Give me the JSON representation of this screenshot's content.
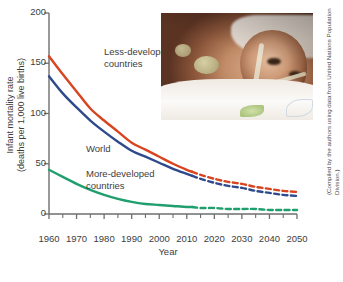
{
  "chart_data": {
    "type": "line",
    "title": "",
    "xlabel": "Year",
    "ylabel": "Infant mortality rate (deaths per 1,000 live births)",
    "ylabel_line1": "Infant mortality rate",
    "ylabel_line2": "(deaths per 1,000 live births)",
    "xlim": [
      1960,
      2050
    ],
    "ylim": [
      0,
      200
    ],
    "yticks": [
      0,
      50,
      100,
      150,
      200
    ],
    "ytick_labels": [
      "0",
      "50",
      "100",
      "150",
      "200"
    ],
    "xticks": [
      1960,
      1970,
      1980,
      1990,
      2000,
      2010,
      2020,
      2030,
      2040,
      2050
    ],
    "xtick_labels": [
      "1960",
      "1970",
      "1980",
      "1990",
      "2000",
      "2010",
      "2020",
      "2030",
      "2040",
      "2050"
    ],
    "xminor_step": 5,
    "grid": false,
    "legend": "inline-annotations",
    "projection_starts": 2012,
    "x": [
      1960,
      1965,
      1970,
      1975,
      1980,
      1985,
      1990,
      1995,
      2000,
      2005,
      2010,
      2012,
      2015,
      2020,
      2025,
      2030,
      2035,
      2040,
      2045,
      2050
    ],
    "series": [
      {
        "name": "Less-developed countries",
        "color": "#d8441f",
        "values": [
          157,
          139,
          122,
          105,
          93,
          82,
          71,
          64,
          57,
          50,
          44,
          42,
          39,
          35,
          32,
          30,
          27,
          25,
          23,
          22
        ]
      },
      {
        "name": "World",
        "color": "#2e4a8c",
        "values": [
          137,
          120,
          106,
          93,
          82,
          72,
          63,
          57,
          51,
          45,
          40,
          38,
          35,
          31,
          28,
          26,
          23,
          21,
          19,
          18
        ]
      },
      {
        "name": "More-developed countries",
        "color": "#1f9e6e",
        "values": [
          44,
          37,
          30,
          24,
          19,
          15,
          12,
          10,
          9,
          8,
          7,
          7,
          6,
          6,
          5,
          5,
          5,
          4,
          4,
          4
        ]
      }
    ],
    "annotations": [
      {
        "text_line1": "Less-developed",
        "text_line2": "countries",
        "target": "Less-developed countries"
      },
      {
        "text_line1": "World",
        "text_line2": "",
        "target": "World"
      },
      {
        "text_line1": "More-developed",
        "text_line2": "countries",
        "target": "More-developed countries"
      }
    ],
    "credit": "(Compiled by the authors using data from United Nations Population Division.)",
    "inset_image": {
      "name": "premature-infant-photo",
      "description": "Photograph of a premature newborn infant with a feeding tube lying on a white blanket"
    }
  }
}
